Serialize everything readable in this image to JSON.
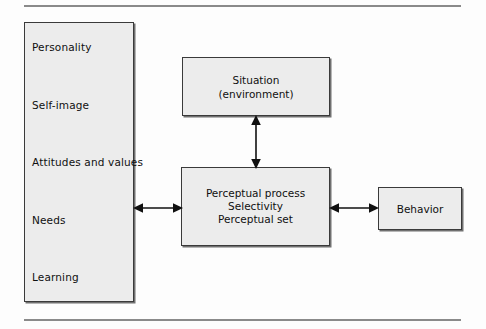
{
  "figure": {
    "title_rule_top": "horizontal-rule",
    "title_rule_bottom": "horizontal-rule"
  },
  "nodes": {
    "factors": {
      "name": "personal-factors",
      "items": [
        {
          "label": "Personality"
        },
        {
          "label": "Self-image"
        },
        {
          "label": "Attitudes and values"
        },
        {
          "label": "Needs"
        },
        {
          "label": "Learning"
        }
      ]
    },
    "situation": {
      "line1": "Situation",
      "line2": "(environment)"
    },
    "perception": {
      "line1": "Perceptual process",
      "line2": "Selectivity",
      "line3": "Perceptual set"
    },
    "behavior": {
      "label": "Behavior"
    }
  },
  "arrows": [
    {
      "name": "factors-to-perception",
      "direction": "bidirectional",
      "orientation": "horizontal"
    },
    {
      "name": "situation-to-perception",
      "direction": "bidirectional",
      "orientation": "vertical"
    },
    {
      "name": "perception-to-behavior",
      "direction": "bidirectional",
      "orientation": "horizontal"
    }
  ],
  "colors": {
    "box_fill": "#ececec",
    "box_border": "#3a3a3a",
    "box_shadow": "#707070",
    "rule": "#8a8a8a",
    "text": "#101010",
    "page_background": "#fdfdfd"
  }
}
